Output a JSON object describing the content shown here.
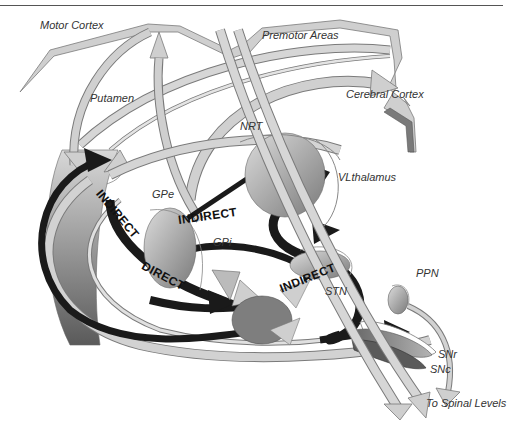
{
  "colors": {
    "background": "#ffffff",
    "light_arrow": "#cfcfcf",
    "light_arrow_edge": "#7a7a7a",
    "mid_gray": "#9a9a9a",
    "dark_gray": "#6e6e6e",
    "black_arrow": "#1a1a1a",
    "label_text": "#333333"
  },
  "regions": {
    "motor_cortex": "Motor Cortex",
    "premotor_areas": "Premotor Areas",
    "cerebral_cortex": "Cerebral Cortex",
    "putamen": "Putamen",
    "nrt": "NRT",
    "vl_thalamus": "VLthalamus",
    "gpe": "GPe",
    "gpi": "GPi",
    "stn": "STN",
    "ppn": "PPN",
    "snr": "SNr",
    "snc": "SNc",
    "spinal": "To Spinal Levels"
  },
  "pathways": {
    "indirect_1": "INDIRECT",
    "indirect_2": "INDIRECT",
    "indirect_3": "INDIRECT",
    "direct": "DIRECT"
  }
}
